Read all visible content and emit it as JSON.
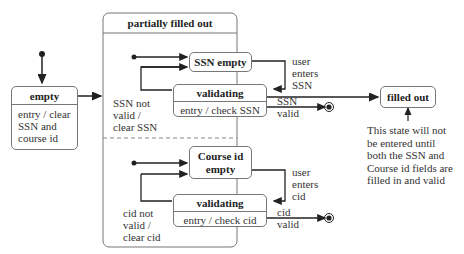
{
  "diagram": {
    "type": "uml-state-machine",
    "states": {
      "empty": {
        "name": "empty",
        "activity": "entry / clear\nSSN and\ncourse id"
      },
      "partially_filled_out": {
        "name": "partially filled out",
        "region1": {
          "ssn_empty": {
            "name": "SSN empty"
          },
          "validating": {
            "name": "validating",
            "activity": "entry / check SSN"
          }
        },
        "region2": {
          "course_id_empty": {
            "name": "Course id\nempty"
          },
          "validating": {
            "name": "validating",
            "activity": "entry / check cid"
          }
        }
      },
      "filled_out": {
        "name": "filled out"
      }
    },
    "transitions": {
      "user_enters_ssn": "user\nenters\nSSN",
      "ssn_not_valid": "SSN not\nvalid /\nclear SSN",
      "ssn_valid": "SSN\nvalid",
      "user_enters_cid": "user\nenters\ncid",
      "cid_not_valid": "cid not\nvalid /\nclear cid",
      "cid_valid": "cid\nvalid"
    },
    "note": "This state will not\nbe entered until\nboth the SSN and\nCourse id fields are\nfilled in and valid",
    "colors": {
      "line": "#222222",
      "border": "#777777"
    }
  }
}
